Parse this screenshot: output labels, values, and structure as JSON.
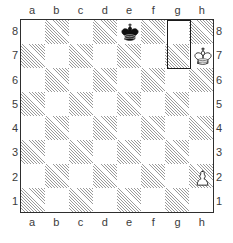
{
  "diagram": {
    "board": {
      "files": [
        "a",
        "b",
        "c",
        "d",
        "e",
        "f",
        "g",
        "h"
      ],
      "ranks": [
        "8",
        "7",
        "6",
        "5",
        "4",
        "3",
        "2",
        "1"
      ],
      "orientation": "white-bottom",
      "light_square_color": "#ffffff",
      "dark_square_color": "#9a9a9a",
      "border_color": "#2e2e2e",
      "label_color": "#3b3b3b",
      "highlight_color": "#1a1a1a"
    },
    "pieces": [
      {
        "square": "e8",
        "color": "black",
        "type": "king",
        "glyph": "♚",
        "label": "black-king-e8"
      },
      {
        "square": "h7",
        "color": "white",
        "type": "king",
        "glyph": "♔",
        "label": "white-king-h7"
      },
      {
        "square": "h2",
        "color": "white",
        "type": "pawn",
        "glyph": "♙",
        "label": "white-pawn-h2"
      }
    ],
    "highlight": {
      "squares": [
        "g8",
        "g7"
      ],
      "description": "outlined rectangle spanning g8 and g7"
    },
    "caption": {
      "text": ""
    }
  }
}
